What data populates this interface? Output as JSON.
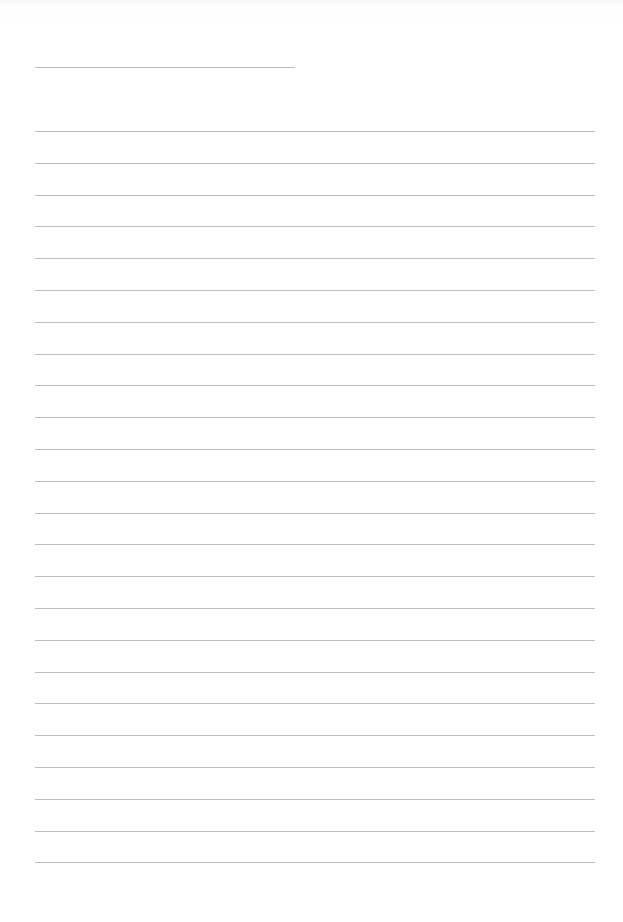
{
  "page": {
    "type": "blank lined notepaper",
    "title_line": {
      "x": 35,
      "y": 67,
      "width": 260
    },
    "ruled_lines": {
      "count": 24,
      "first_y": 131,
      "spacing": 31.8,
      "x": 35,
      "width": 560
    },
    "line_color": "#bdbdbd",
    "background_color": "#ffffff",
    "text_content": ""
  }
}
